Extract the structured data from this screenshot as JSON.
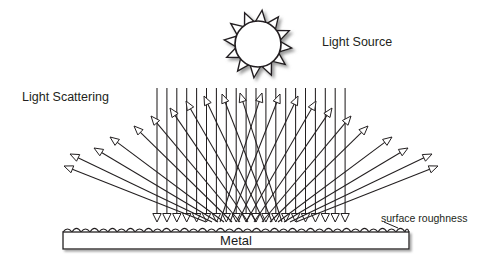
{
  "diagram": {
    "title_labels": {
      "light_source": "Light Source",
      "light_scattering": "Light Scattering",
      "surface_roughness": "surface roughness",
      "metal": "Metal"
    },
    "colors": {
      "stroke": "#231f20",
      "background": "#ffffff",
      "fill_white": "#ffffff",
      "shadow": "#b3b3b3",
      "text": "#231f20"
    },
    "sun": {
      "name": "sun-light-source",
      "center_x": 258,
      "center_y": 44,
      "radius": 23,
      "spike_count": 12,
      "spike_length": 11,
      "spike_half_width": 5.5
    },
    "metal_bar": {
      "x": 63,
      "y": 232,
      "width": 346,
      "height": 17,
      "label": "Metal"
    },
    "rough_surface": {
      "start_x": 63,
      "end_x": 409,
      "baseline_y": 232,
      "bump_width": 9,
      "bump_height": 6,
      "bump_count": 38
    },
    "incident_rays": {
      "name": "incident-light-rays",
      "description": "vertical downward rays from light source to metal surface",
      "count": 20,
      "start_x": 157,
      "spacing": 9.9,
      "top_y": 88,
      "bottom_y": 222,
      "arrowhead": "open-triangle-down"
    },
    "scattered_rays_left": {
      "name": "scattered-rays-left",
      "description": "rays scattered up and to the left with open arrowheads",
      "count": 11,
      "arrowhead": "open-triangle",
      "rays": [
        {
          "x1": 206,
          "y1": 222,
          "x2": 64,
          "y2": 166
        },
        {
          "x1": 212,
          "y1": 222,
          "x2": 70,
          "y2": 154
        },
        {
          "x1": 218,
          "y1": 222,
          "x2": 94,
          "y2": 148
        },
        {
          "x1": 224,
          "y1": 222,
          "x2": 110,
          "y2": 137
        },
        {
          "x1": 232,
          "y1": 222,
          "x2": 134,
          "y2": 126
        },
        {
          "x1": 240,
          "y1": 222,
          "x2": 151,
          "y2": 116
        },
        {
          "x1": 248,
          "y1": 222,
          "x2": 170,
          "y2": 108
        },
        {
          "x1": 256,
          "y1": 222,
          "x2": 186,
          "y2": 101
        },
        {
          "x1": 264,
          "y1": 222,
          "x2": 204,
          "y2": 96
        },
        {
          "x1": 272,
          "y1": 222,
          "x2": 222,
          "y2": 94
        },
        {
          "x1": 282,
          "y1": 222,
          "x2": 240,
          "y2": 93
        }
      ]
    },
    "scattered_rays_right": {
      "name": "scattered-rays-right",
      "description": "rays scattered up and to the right with open arrowheads",
      "count": 11,
      "arrowhead": "open-triangle",
      "rays": [
        {
          "x1": 296,
          "y1": 222,
          "x2": 438,
          "y2": 166
        },
        {
          "x1": 290,
          "y1": 222,
          "x2": 432,
          "y2": 154
        },
        {
          "x1": 284,
          "y1": 222,
          "x2": 408,
          "y2": 148
        },
        {
          "x1": 278,
          "y1": 222,
          "x2": 392,
          "y2": 137
        },
        {
          "x1": 270,
          "y1": 222,
          "x2": 368,
          "y2": 126
        },
        {
          "x1": 262,
          "y1": 222,
          "x2": 351,
          "y2": 116
        },
        {
          "x1": 254,
          "y1": 222,
          "x2": 332,
          "y2": 108
        },
        {
          "x1": 246,
          "y1": 222,
          "x2": 316,
          "y2": 101
        },
        {
          "x1": 238,
          "y1": 222,
          "x2": 298,
          "y2": 96
        },
        {
          "x1": 230,
          "y1": 222,
          "x2": 280,
          "y2": 94
        },
        {
          "x1": 220,
          "y1": 222,
          "x2": 262,
          "y2": 93
        }
      ]
    }
  }
}
